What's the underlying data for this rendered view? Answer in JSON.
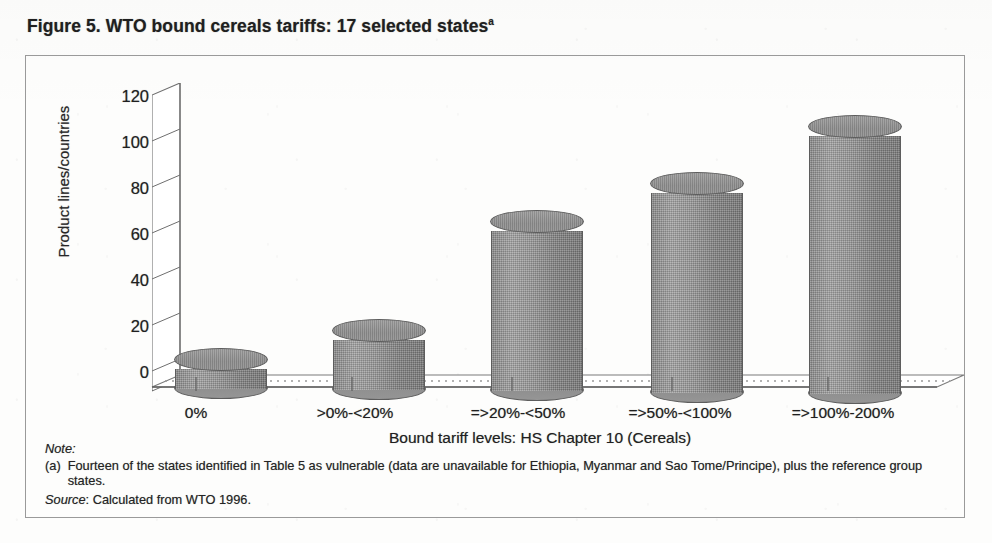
{
  "figure": {
    "title": "Figure 5. WTO bound cereals tariffs: 17 selected states",
    "title_superscript": "a"
  },
  "notes": {
    "heading": "Note:",
    "marker": "(a)",
    "text": "Fourteen of the states identified in Table 5 as vulnerable (data are unavailable for Ethiopia, Myanmar and Sao Tome/Principe), plus the reference group states.",
    "source_label": "Source",
    "source_text": ": Calculated from WTO 1996."
  },
  "chart_data": {
    "type": "bar",
    "title": "Figure 5. WTO bound cereals tariffs: 17 selected states",
    "xlabel": "Bound tariff levels: HS Chapter 10 (Cereals)",
    "ylabel": "Product lines/countries",
    "categories": [
      "0%",
      ">0%-<20%",
      "=>20%-<50%",
      "=>50%-<100%",
      "=>100%-200%"
    ],
    "values": [
      12,
      24,
      68,
      84,
      107
    ],
    "ylim": [
      0,
      120
    ],
    "yticks": [
      0,
      20,
      40,
      60,
      80,
      100,
      120
    ],
    "grid": true,
    "legend": "none",
    "style": "3d-cylinder",
    "bar_color": "#949494"
  }
}
